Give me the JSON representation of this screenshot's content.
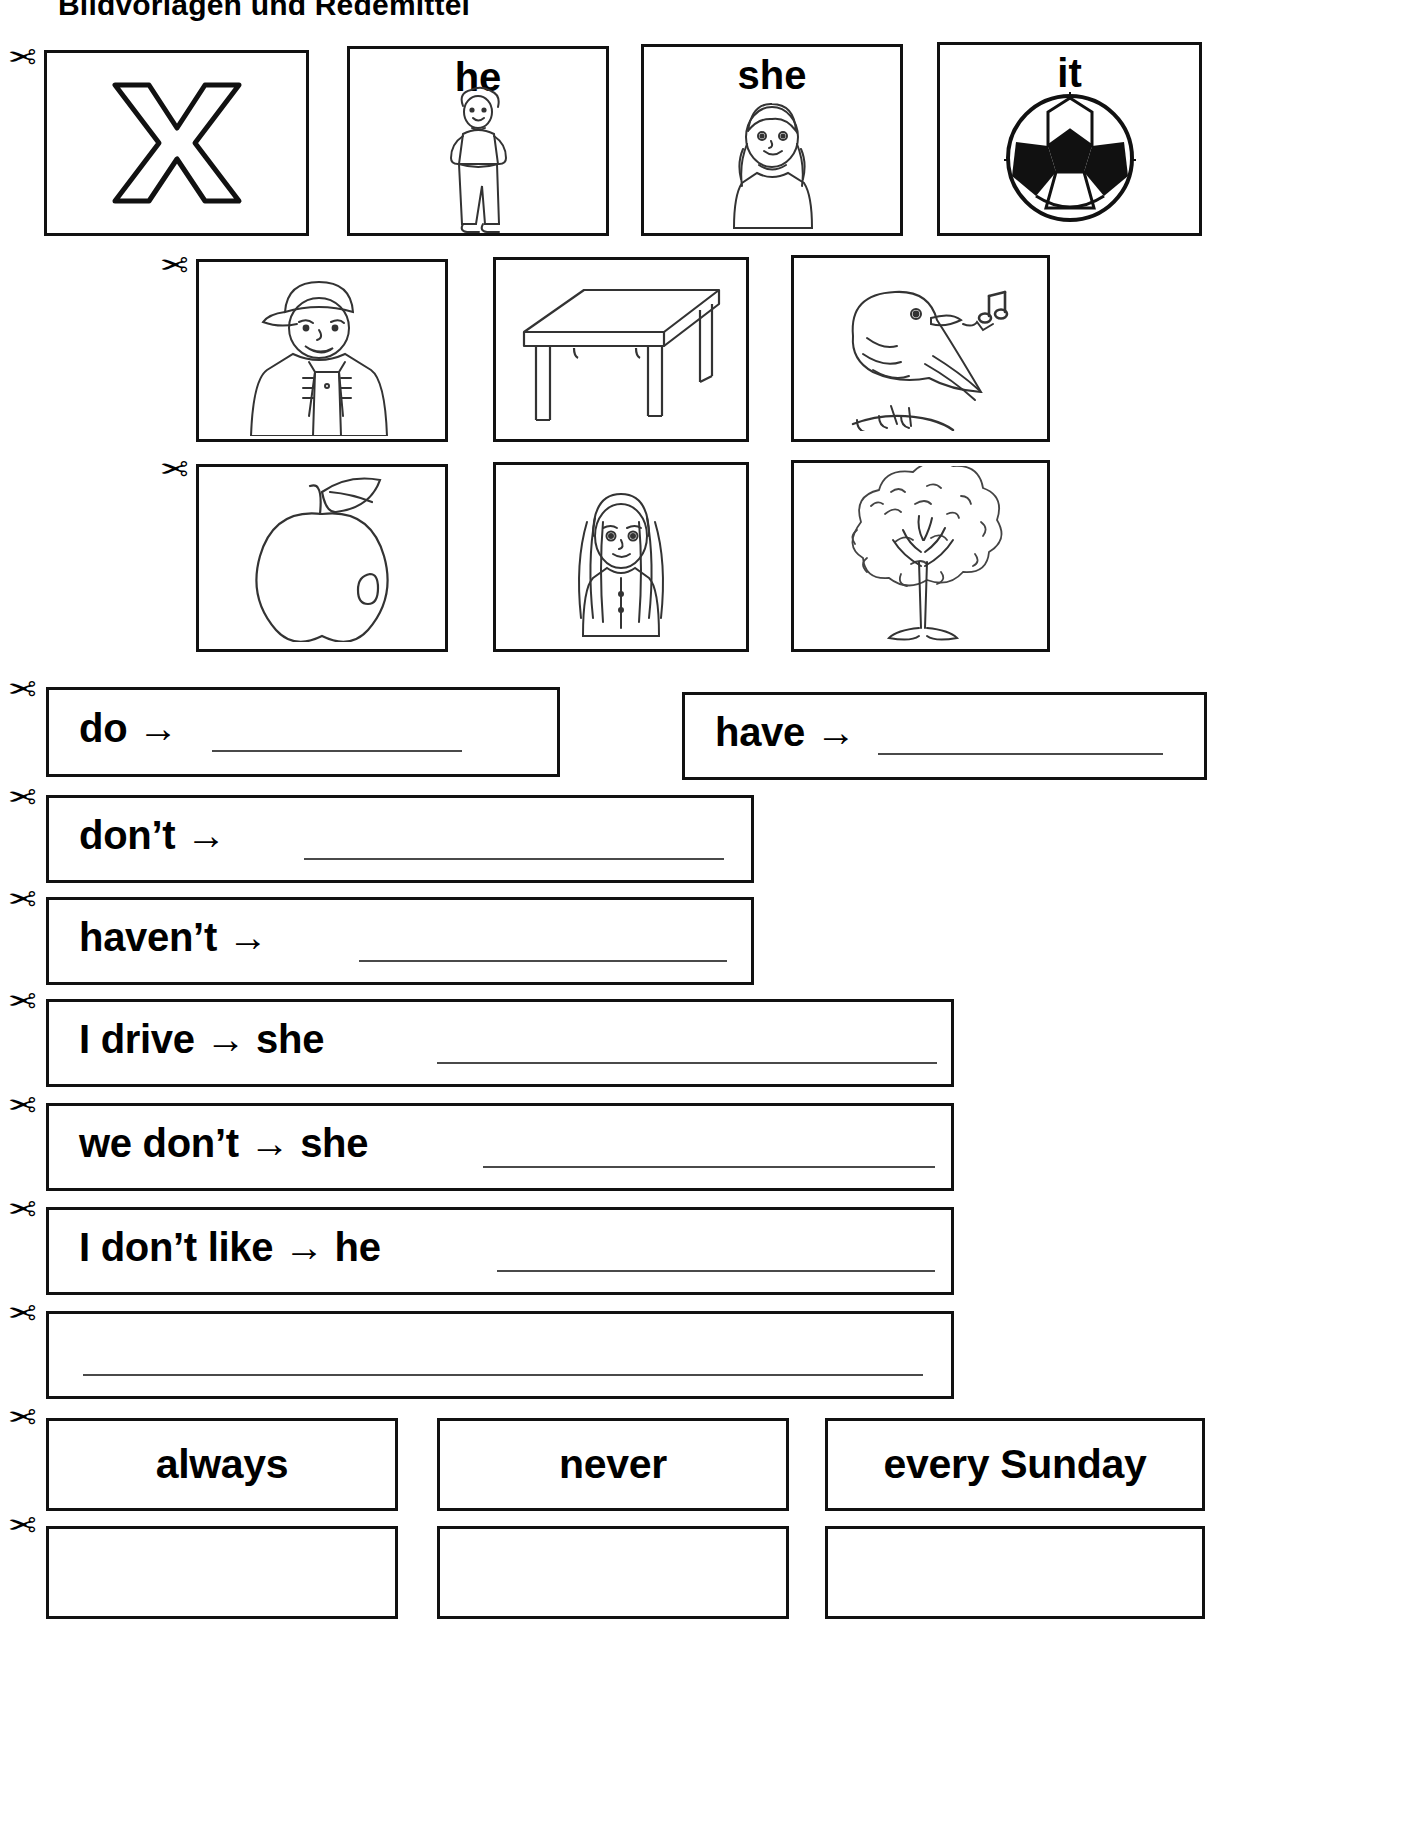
{
  "header": {
    "title": "Bildvorlagen und Redemittel"
  },
  "cut_marker": "✂",
  "picture_rows": [
    {
      "row_id": "row-1",
      "cards": [
        {
          "label": "",
          "art": "letter-x",
          "art_name": "letter-x-icon"
        },
        {
          "label": "he",
          "art": "boy-standing",
          "art_name": "boy-standing-illustration"
        },
        {
          "label": "she",
          "art": "girl-braids",
          "art_name": "girl-with-braids-illustration"
        },
        {
          "label": "it",
          "art": "soccer-ball",
          "art_name": "soccer-ball-illustration"
        }
      ]
    },
    {
      "row_id": "row-2",
      "cards": [
        {
          "label": "",
          "art": "man-cap-overalls",
          "art_name": "man-with-cap-illustration"
        },
        {
          "label": "",
          "art": "table",
          "art_name": "table-illustration"
        },
        {
          "label": "",
          "art": "singing-bird",
          "art_name": "singing-bird-illustration"
        }
      ]
    },
    {
      "row_id": "row-3",
      "cards": [
        {
          "label": "",
          "art": "apple",
          "art_name": "apple-illustration"
        },
        {
          "label": "",
          "art": "woman-long-hair",
          "art_name": "woman-long-hair-illustration"
        },
        {
          "label": "",
          "art": "tree",
          "art_name": "tree-illustration"
        }
      ]
    }
  ],
  "sentence_strips": [
    {
      "id": "strip-do",
      "text": "do →",
      "has_line": true
    },
    {
      "id": "strip-have",
      "text": "have →",
      "has_line": true
    },
    {
      "id": "strip-dont",
      "text": "don’t →",
      "has_line": true
    },
    {
      "id": "strip-havent",
      "text": "haven’t →",
      "has_line": true
    },
    {
      "id": "strip-i-drive",
      "text": "I drive → she",
      "has_line": true
    },
    {
      "id": "strip-we-dont",
      "text": "we don’t → she",
      "has_line": true
    },
    {
      "id": "strip-i-dont-like",
      "text": "I don’t like → he",
      "has_line": true
    },
    {
      "id": "strip-blank",
      "text": "",
      "has_line": true
    }
  ],
  "word_cards": [
    {
      "id": "card-always",
      "label": "always"
    },
    {
      "id": "card-never",
      "label": "never"
    },
    {
      "id": "card-every-sunday",
      "label": "every Sunday"
    },
    {
      "id": "card-blank-1",
      "label": ""
    },
    {
      "id": "card-blank-2",
      "label": ""
    },
    {
      "id": "card-blank-3",
      "label": ""
    }
  ],
  "colors": {
    "ink": "#111111",
    "line": "#4a4a4a",
    "paper": "#ffffff"
  }
}
